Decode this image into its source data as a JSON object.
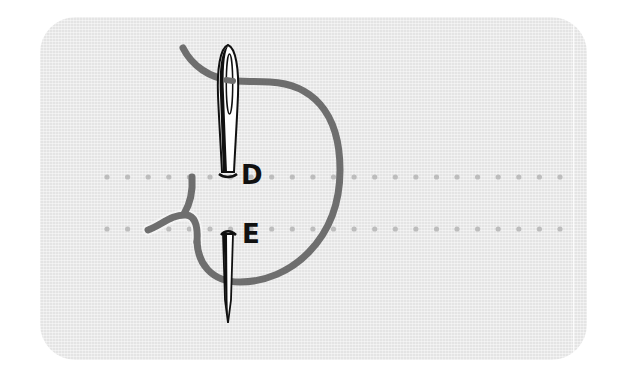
{
  "diagram": {
    "type": "sewing-stitch-illustration",
    "labels": {
      "point_d": "D",
      "point_e": "E"
    },
    "fabric": {
      "color": "#e4e4e4",
      "dot_color": "#bdbdbd",
      "rows": [
        {
          "y": 177,
          "x_start": 107,
          "x_end": 560,
          "count": 23
        },
        {
          "y": 229,
          "x_start": 107,
          "x_end": 560,
          "count": 23
        }
      ]
    },
    "thread": {
      "color": "#6e6e6e",
      "width": 7
    },
    "needles": [
      {
        "name": "upper-needle",
        "eye_top": 45,
        "base": 175,
        "x": 228
      },
      {
        "name": "lower-needle",
        "top": 230,
        "tip": 323,
        "x": 228
      }
    ]
  }
}
